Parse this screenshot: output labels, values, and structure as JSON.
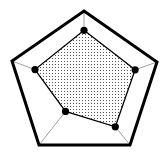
{
  "chart_data": {
    "type": "radar",
    "title": "",
    "axes": [
      "axis-1 (top)",
      "axis-2 (right)",
      "axis-3 (bottom-right)",
      "axis-4 (bottom-left)",
      "axis-5 (left)"
    ],
    "values": [
      0.75,
      0.7,
      0.68,
      0.41,
      0.68
    ],
    "range": [
      0,
      1
    ],
    "center": [
      84,
      88
    ],
    "outer_vertices": [
      [
        84,
        11
      ],
      [
        157,
        62
      ],
      [
        130,
        145
      ],
      [
        39,
        145
      ],
      [
        12,
        61
      ]
    ],
    "marker": "filled-circle",
    "fill": "dot-pattern",
    "grid": "spokes"
  },
  "colors": {
    "outline": "#000000",
    "spoke": "#888888",
    "fill_dot": "#555555",
    "background": "#ffffff"
  }
}
